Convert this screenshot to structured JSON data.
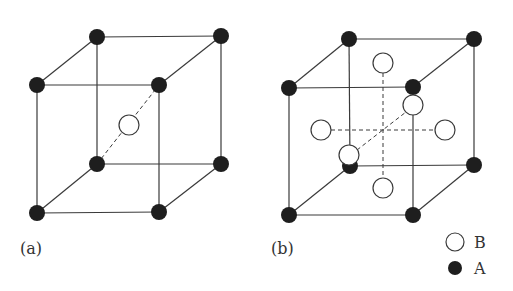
{
  "diagram": {
    "panels": [
      {
        "label": "(a)",
        "structure": "body-centered cube",
        "corner_atoms": "A",
        "center_atoms": [
          "B at body center"
        ]
      },
      {
        "label": "(b)",
        "structure": "cube with face-centered atoms",
        "corner_atoms": "A",
        "center_atoms": [
          "B at top face",
          "B at bottom face",
          "B at left face",
          "B at right face",
          "B at front face",
          "B at back face"
        ]
      }
    ],
    "legend": {
      "items": [
        {
          "symbol": "open-circle",
          "label": "B"
        },
        {
          "symbol": "filled-circle",
          "label": "A"
        }
      ]
    },
    "colors": {
      "atom_A": "#1e1e1e",
      "atom_B_fill": "#ffffff",
      "lines": "#3a3a3a"
    }
  }
}
